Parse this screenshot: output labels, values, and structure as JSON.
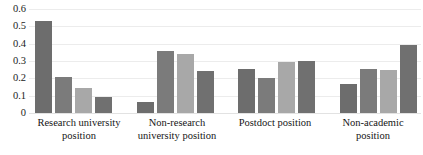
{
  "chart_data": {
    "type": "bar",
    "title": "",
    "subtitle": "",
    "xlabel": "",
    "ylabel": "",
    "ylim": [
      0,
      0.6
    ],
    "grid": true,
    "legend": "none",
    "y_ticks": [
      "0.6",
      "0.5",
      "0.4",
      "0.3",
      "0.2",
      "0.1",
      "0"
    ],
    "y_tick_values": [
      0.6,
      0.5,
      0.4,
      0.3,
      0.2,
      0.1,
      0
    ],
    "categories": [
      "Research university position",
      "Non-research university position",
      "Postdoct position",
      "Non-academic position"
    ],
    "series": [
      {
        "name": "Series 1",
        "color": "#6d6d6d",
        "values": [
          0.53,
          0.065,
          0.255,
          0.17
        ]
      },
      {
        "name": "Series 2",
        "color": "#7b7b7b",
        "values": [
          0.21,
          0.36,
          0.2,
          0.255
        ]
      },
      {
        "name": "Series 3",
        "color": "#a8a8a8",
        "values": [
          0.145,
          0.34,
          0.295,
          0.25
        ]
      },
      {
        "name": "Series 4",
        "color": "#707070",
        "values": [
          0.09,
          0.245,
          0.3,
          0.395
        ]
      }
    ],
    "colors": {
      "gridline": "#ececec",
      "background": "#ffffff",
      "text": "#151515"
    }
  }
}
